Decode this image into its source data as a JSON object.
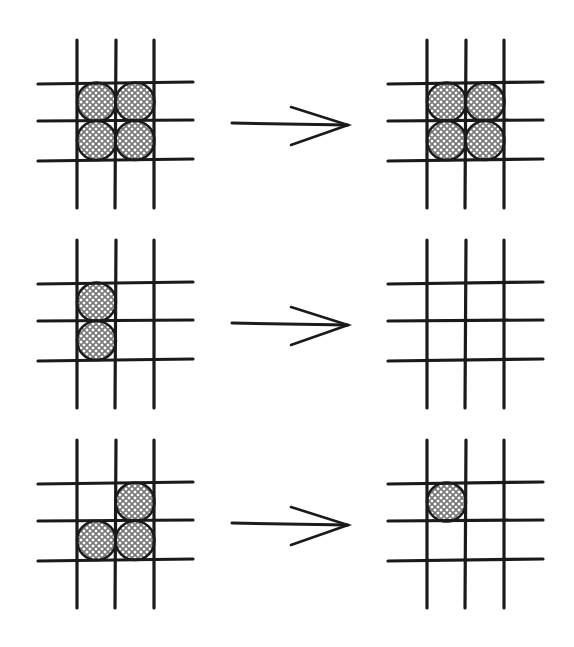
{
  "diagram": {
    "colors": {
      "line": "#1a1a1a",
      "stone_fill": "#c8c8c8",
      "hatch": "#6a6a6a",
      "background": "#ffffff"
    },
    "rows": [
      {
        "before": {
          "filled": [
            [
              0,
              0
            ],
            [
              0,
              1
            ],
            [
              1,
              0
            ],
            [
              1,
              1
            ]
          ]
        },
        "arrow": "right-arrow",
        "after": {
          "filled": [
            [
              0,
              0
            ],
            [
              0,
              1
            ],
            [
              1,
              0
            ],
            [
              1,
              1
            ]
          ]
        }
      },
      {
        "before": {
          "filled": [
            [
              0,
              0
            ],
            [
              1,
              0
            ]
          ]
        },
        "arrow": "right-arrow",
        "after": {
          "filled": []
        }
      },
      {
        "before": {
          "filled": [
            [
              0,
              1
            ],
            [
              1,
              0
            ],
            [
              1,
              1
            ]
          ]
        },
        "arrow": "right-arrow",
        "after": {
          "filled": [
            [
              0,
              0
            ]
          ]
        }
      }
    ]
  }
}
